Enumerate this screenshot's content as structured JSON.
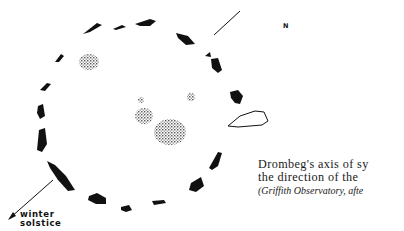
{
  "figure": {
    "north_label": "N",
    "arrow_label_lines": [
      "winter",
      "solstice"
    ],
    "ink_color": "#111111",
    "stipple_color": "#333333"
  },
  "caption": {
    "lines": [
      "Drombeg's axis of sy",
      "the direction of the"
    ],
    "credit": "(Griffith Observatory, afte"
  }
}
